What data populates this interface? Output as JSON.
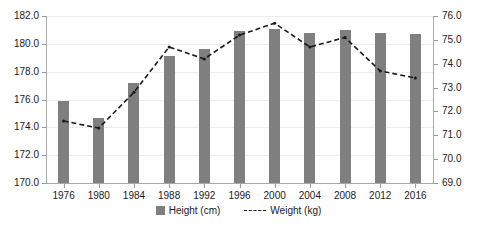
{
  "chart_data": {
    "type": "bar",
    "title": "",
    "xlabel": "",
    "categories": [
      "1976",
      "1980",
      "1984",
      "1988",
      "1992",
      "1996",
      "2000",
      "2004",
      "2008",
      "2012",
      "2016"
    ],
    "series": [
      {
        "name": "Height (cm)",
        "type": "bar",
        "axis": "left",
        "color": "#7f7f7f",
        "values": [
          175.9,
          174.7,
          177.2,
          179.1,
          179.6,
          180.9,
          181.1,
          180.8,
          181.0,
          180.8,
          180.7
        ]
      },
      {
        "name": "Weight (kg)",
        "type": "line",
        "axis": "right",
        "style": "dashed",
        "color": "#1a1a1a",
        "values": [
          71.6,
          71.3,
          72.8,
          74.7,
          74.2,
          75.2,
          75.7,
          74.7,
          75.1,
          73.7,
          73.4
        ]
      }
    ],
    "left_axis": {
      "label": "Height (cm)",
      "min": 170.0,
      "max": 182.0,
      "ticks": [
        "170.0",
        "172.0",
        "174.0",
        "176.0",
        "178.0",
        "180.0",
        "182.0"
      ],
      "tick_values": [
        170.0,
        172.0,
        174.0,
        176.0,
        178.0,
        180.0,
        182.0
      ]
    },
    "right_axis": {
      "label": "Weight (kg)",
      "min": 69.0,
      "max": 76.0,
      "ticks": [
        "69.0",
        "70.0",
        "71.0",
        "72.0",
        "73.0",
        "74.0",
        "75.0",
        "76.0"
      ],
      "tick_values": [
        69.0,
        70.0,
        71.0,
        72.0,
        73.0,
        74.0,
        75.0,
        76.0
      ]
    },
    "grid": true,
    "legend_position": "bottom",
    "legend": [
      {
        "label": "Height (cm)",
        "marker": "square",
        "color": "#7f7f7f"
      },
      {
        "label": "Weight (kg)",
        "marker": "dashed-line",
        "color": "#1a1a1a"
      }
    ]
  }
}
